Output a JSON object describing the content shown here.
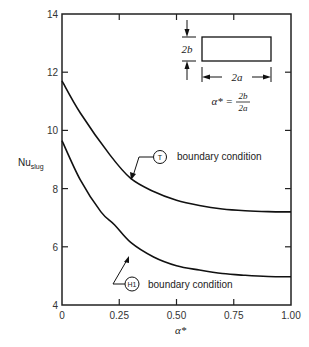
{
  "chart_data": {
    "type": "line",
    "title": "",
    "xlabel": "α*",
    "ylabel": "Nu_slug",
    "ylabel_main": "Nu",
    "ylabel_sub": "slug",
    "xlim": [
      0,
      1.0
    ],
    "ylim": [
      4,
      14
    ],
    "grid": false,
    "x_ticks": [
      0,
      0.25,
      0.5,
      0.75,
      1.0
    ],
    "x_tick_labels": [
      "0",
      "0.25",
      "0.50",
      "0.75",
      "1.00"
    ],
    "y_ticks": [
      4,
      6,
      8,
      10,
      12,
      14
    ],
    "y_tick_labels": [
      "4",
      "6",
      "8",
      "10",
      "12",
      "14"
    ],
    "series": [
      {
        "name": "T boundary condition",
        "marker_label": "T",
        "x": [
          0,
          0.08,
          0.21,
          0.3,
          0.4,
          0.5,
          0.6,
          0.7,
          0.8,
          0.9,
          1.0
        ],
        "values": [
          11.7,
          10.6,
          9.15,
          8.35,
          7.9,
          7.6,
          7.42,
          7.3,
          7.24,
          7.21,
          7.2
        ]
      },
      {
        "name": "H1 boundary condition",
        "marker_label": "H1",
        "x": [
          0,
          0.08,
          0.17,
          0.23,
          0.3,
          0.4,
          0.5,
          0.6,
          0.7,
          0.8,
          0.9,
          1.0
        ],
        "values": [
          9.65,
          8.3,
          7.2,
          6.75,
          6.15,
          5.65,
          5.35,
          5.2,
          5.08,
          5.02,
          4.98,
          4.97
        ]
      }
    ],
    "annotations": [
      {
        "text": "boundary condition",
        "symbol": "T"
      },
      {
        "text": "boundary condition",
        "symbol": "H1"
      },
      {
        "text": "α* = 2b / 2a"
      }
    ],
    "inset": {
      "height_label": "2b",
      "width_label": "2a",
      "formula_lhs": "α* =",
      "formula_num": "2b",
      "formula_den": "2a"
    }
  },
  "labels": {
    "t_symbol": "T",
    "h1_symbol": "H1",
    "bc_text": "boundary condition"
  }
}
